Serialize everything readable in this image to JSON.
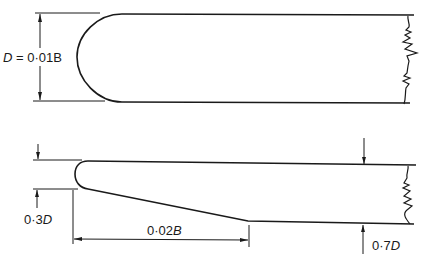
{
  "diagram": {
    "type": "engineering-cross-section",
    "colors": {
      "line": "#1a1a1a",
      "background": "#ffffff"
    },
    "top_figure": {
      "description": "Rounded leading edge, constant thickness section",
      "dimension_label": {
        "var": "D",
        "eq": " = 0·01B"
      }
    },
    "bottom_figure": {
      "description": "Tapered leading edge section",
      "labels": {
        "nose": {
          "num": "0·3",
          "var": "D"
        },
        "taper_length": {
          "num": "0·02",
          "var": "B"
        },
        "thickness": {
          "num": "0·7",
          "var": "D"
        }
      }
    }
  }
}
